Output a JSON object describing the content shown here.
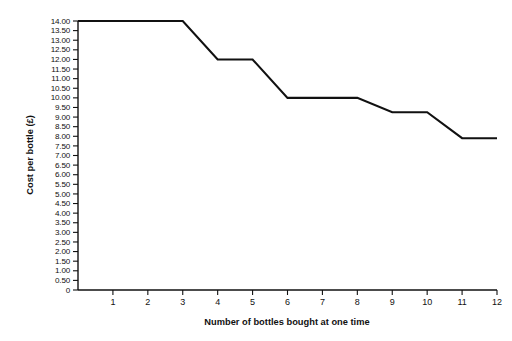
{
  "chart_data": {
    "type": "line",
    "title": "",
    "xlabel": "Number of bottles bought at one time",
    "ylabel": "Cost per bottle (£)",
    "xlim": [
      0,
      12
    ],
    "ylim": [
      0,
      14
    ],
    "grid": false,
    "legend": "none",
    "currency_symbol": "£",
    "x_tick_labels": [
      "1",
      "2",
      "3",
      "4",
      "5",
      "6",
      "7",
      "8",
      "9",
      "10",
      "11",
      "12"
    ],
    "x_tick_values": [
      1,
      2,
      3,
      4,
      5,
      6,
      7,
      8,
      9,
      10,
      11,
      12
    ],
    "y_tick_labels": [
      "14.00",
      "13.50",
      "13.00",
      "12.50",
      "12.00",
      "11.50",
      "11.00",
      "10.50",
      "10.00",
      "9.50",
      "9.00",
      "8.50",
      "8.00",
      "7.50",
      "7.00",
      "6.50",
      "6.00",
      "5.50",
      "5.00",
      "4.50",
      "4.00",
      "3.50",
      "3.00",
      "2.50",
      "2.00",
      "1.50",
      "1.00",
      "0.50",
      "0"
    ],
    "y_tick_values": [
      14.0,
      13.5,
      13.0,
      12.5,
      12.0,
      11.5,
      11.0,
      10.5,
      10.0,
      9.5,
      9.0,
      8.5,
      8.0,
      7.5,
      7.0,
      6.5,
      6.0,
      5.5,
      5.0,
      4.5,
      4.0,
      3.5,
      3.0,
      2.5,
      2.0,
      1.5,
      1.0,
      0.5,
      0
    ],
    "series": [
      {
        "name": "Cost per bottle",
        "x": [
          0,
          3,
          4,
          5,
          6,
          8,
          9,
          10,
          11,
          12
        ],
        "values": [
          14.0,
          14.0,
          12.0,
          12.0,
          10.0,
          10.0,
          9.25,
          9.25,
          7.9,
          7.9
        ]
      }
    ],
    "plateaus": [
      {
        "from_x": 0,
        "to_x": 3,
        "value": 14.0
      },
      {
        "from_x": 4,
        "to_x": 5,
        "value": 12.0
      },
      {
        "from_x": 6,
        "to_x": 8,
        "value": 10.0
      },
      {
        "from_x": 9,
        "to_x": 10,
        "value": 9.25
      },
      {
        "from_x": 11,
        "to_x": 12,
        "value": 7.9
      }
    ],
    "line_color": "#111111",
    "background_color": "#ffffff"
  }
}
